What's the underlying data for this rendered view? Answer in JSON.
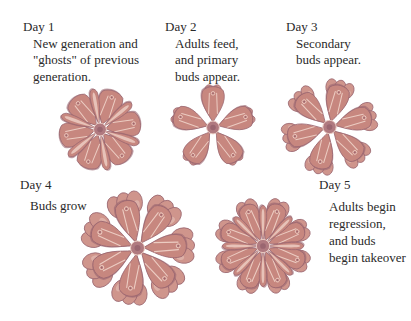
{
  "colors": {
    "zooid_body": "#c7877f",
    "zooid_shadow": "#9a6670",
    "zooid_highlight": "#ecccc2",
    "bud_body": "#cf958c",
    "center": "#b07a80",
    "text": "#2a2a2a"
  },
  "stages": [
    {
      "day": "Day 1",
      "description": [
        "New generation and",
        "\"ghosts\" of previous",
        "generation."
      ],
      "illustration": "colony-with-ghosts",
      "adult_zooids": 6,
      "bud_rings": 0,
      "ghost_zooids": 6
    },
    {
      "day": "Day 2",
      "description": [
        "Adults feed,",
        "and primary",
        "buds appear."
      ],
      "illustration": "colony-primary-buds",
      "adult_zooids": 5,
      "bud_rings": 1,
      "ghost_zooids": 0
    },
    {
      "day": "Day 3",
      "description": [
        "Secondary",
        "buds appear."
      ],
      "illustration": "colony-secondary-buds",
      "adult_zooids": 6,
      "bud_rings": 2,
      "ghost_zooids": 0
    },
    {
      "day": "Day 4",
      "description": [
        "Buds grow"
      ],
      "illustration": "colony-buds-growing",
      "adult_zooids": 6,
      "bud_rings": 2,
      "ghost_zooids": 0
    },
    {
      "day": "Day 5",
      "description": [
        "Adults begin",
        "regression,",
        "and buds",
        "begin takeover"
      ],
      "illustration": "colony-takeover",
      "adult_zooids": 6,
      "bud_rings": 2,
      "ghost_zooids": 6
    }
  ]
}
